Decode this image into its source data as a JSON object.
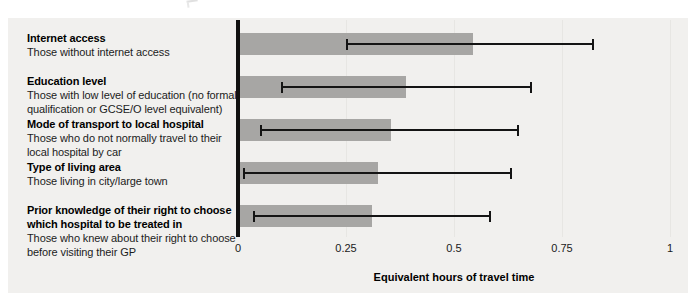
{
  "chart_data": {
    "type": "bar",
    "orientation": "horizontal",
    "xlabel": "Equivalent hours of travel time",
    "xlim": [
      0,
      1
    ],
    "x_ticks": [
      {
        "label": "0",
        "value": 0
      },
      {
        "label": "0.25",
        "value": 0.25
      },
      {
        "label": "0.5",
        "value": 0.5
      },
      {
        "label": "0.75",
        "value": 0.75
      },
      {
        "label": "1",
        "value": 1
      }
    ],
    "grid": "faint-vertical",
    "legend": "none",
    "bar_color": "#a7a6a4",
    "error_bar_color": "#141414",
    "panel_background": "#f1f0ee",
    "rows": [
      {
        "title": "Internet access",
        "subtitle": "Those without internet access",
        "value": 0.545,
        "ci_low": 0.25,
        "ci_high": 0.825
      },
      {
        "title": "Education level",
        "subtitle": "Those with low level of education (no formal\nqualification or GCSE/O level equivalent)",
        "value": 0.39,
        "ci_low": 0.1,
        "ci_high": 0.68
      },
      {
        "title": "Mode of transport to local hospital",
        "subtitle": "Those who do not normally travel to their\nlocal hospital by car",
        "value": 0.355,
        "ci_low": 0.05,
        "ci_high": 0.65
      },
      {
        "title": "Type of living area",
        "subtitle": "Those living in city/large town",
        "value": 0.325,
        "ci_low": 0.012,
        "ci_high": 0.635
      },
      {
        "title": "Prior knowledge of their right to choose\nwhich hospital to be treated in",
        "subtitle": "Those who knew about their right to choose\nbefore visiting their GP",
        "value": 0.31,
        "ci_low": 0.035,
        "ci_high": 0.585
      }
    ]
  }
}
